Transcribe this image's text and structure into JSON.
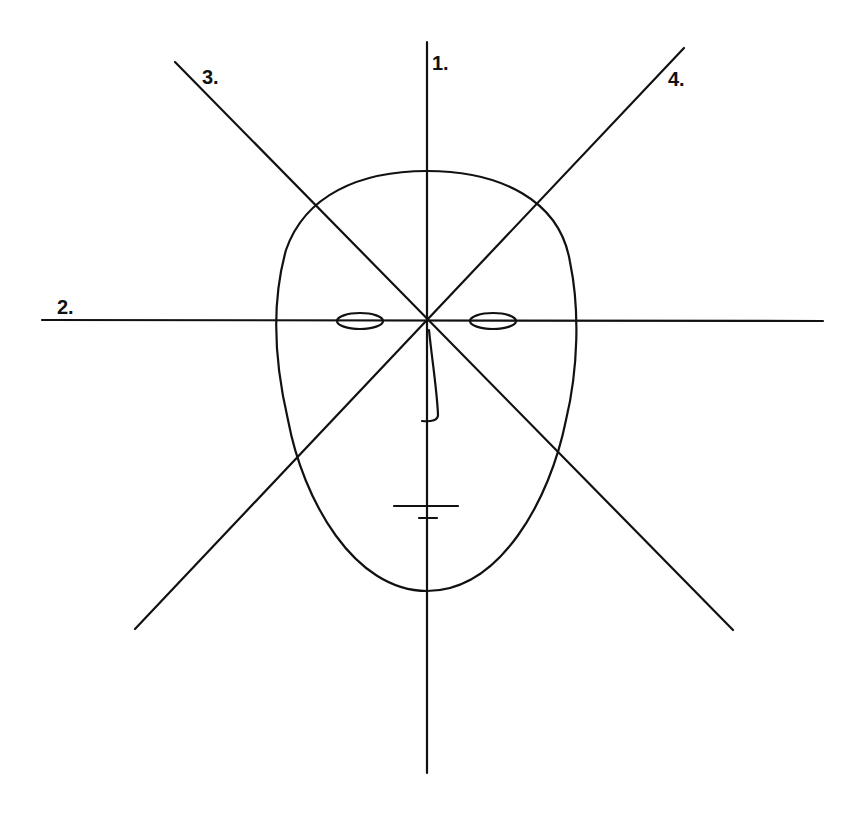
{
  "diagram": {
    "colors": {
      "stroke": "#111111",
      "background": "#ffffff"
    },
    "axes": [
      {
        "id": "1",
        "label": "1.",
        "x1": 427,
        "y1": 42,
        "x2": 427,
        "y2": 773,
        "label_x": 432,
        "label_y": 70
      },
      {
        "id": "2",
        "label": "2.",
        "x1": 42,
        "y1": 320,
        "x2": 823,
        "y2": 321,
        "label_x": 57,
        "label_y": 314
      },
      {
        "id": "3",
        "label": "3.",
        "x1": 175,
        "y1": 62,
        "x2": 733,
        "y2": 630,
        "label_x": 202,
        "label_y": 84
      },
      {
        "id": "4",
        "label": "4.",
        "x1": 684,
        "y1": 48,
        "x2": 135,
        "y2": 629,
        "label_x": 668,
        "label_y": 86
      }
    ],
    "face": {
      "outline": "head-oval",
      "top_y": 171,
      "bottom_y": 591,
      "left_x": 276,
      "right_x": 578,
      "eyes": [
        {
          "name": "left-eye",
          "cx": 360,
          "cy": 321,
          "rx": 23,
          "ry": 8
        },
        {
          "name": "right-eye",
          "cx": 493,
          "cy": 321,
          "rx": 23,
          "ry": 8
        }
      ],
      "mouth": {
        "x1": 394,
        "y1": 506,
        "x2": 458,
        "y2": 506
      },
      "chin_mark": {
        "x1": 419,
        "y1": 518,
        "x2": 437,
        "y2": 518
      }
    }
  }
}
